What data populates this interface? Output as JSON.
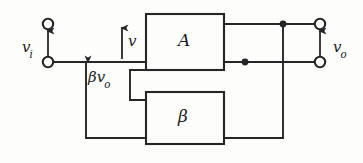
{
  "figure": {
    "kind": "feedback-amplifier-block-diagram",
    "line_color": "#262626",
    "text_color": "#1a1a1a",
    "background": "#fdfdfb"
  },
  "blocks": {
    "forward_gain": {
      "symbol": "A",
      "name": "amplifier-block"
    },
    "feedback": {
      "symbol": "β",
      "name": "feedback-block"
    }
  },
  "labels": {
    "input_voltage": {
      "base": "v",
      "sub": "i"
    },
    "net_input_voltage": {
      "base": "v",
      "sub": ""
    },
    "feedback_voltage": {
      "base": "βv",
      "sub": "o"
    },
    "output_voltage": {
      "base": "v",
      "sub": "o"
    }
  },
  "terminals": [
    {
      "name": "input-terminal-top",
      "x": 48,
      "y": 24
    },
    {
      "name": "input-terminal-bottom",
      "x": 48,
      "y": 62
    },
    {
      "name": "output-terminal-top",
      "x": 320,
      "y": 24
    },
    {
      "name": "output-terminal-bottom",
      "x": 320,
      "y": 62
    }
  ],
  "junctions": [
    {
      "name": "output-top-node",
      "x": 283,
      "y": 24
    },
    {
      "name": "amplifier-out-node",
      "x": 245,
      "y": 62
    }
  ],
  "arrows": [
    {
      "name": "vi-arrow",
      "direction": "up",
      "x": 48,
      "from_y": 56,
      "to_y": 32
    },
    {
      "name": "v-arrow",
      "direction": "up",
      "x": 122,
      "from_y": 58,
      "to_y": 28
    },
    {
      "name": "bvo-arrow",
      "direction": "left",
      "y": 62,
      "from_x": 118,
      "to_x": 86
    },
    {
      "name": "vo-arrow",
      "direction": "up",
      "x": 320,
      "from_y": 56,
      "to_y": 32
    }
  ]
}
